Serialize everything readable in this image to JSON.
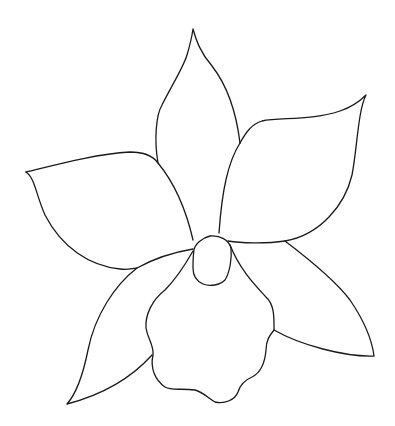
{
  "image": {
    "subject": "orchid flower line drawing",
    "background": "#ffffff",
    "stroke_color": "#1a1a1a",
    "parts": [
      "top-sepal",
      "left-petal",
      "right-petal",
      "lower-left-sepal",
      "lower-right-sepal",
      "lip",
      "column"
    ]
  }
}
